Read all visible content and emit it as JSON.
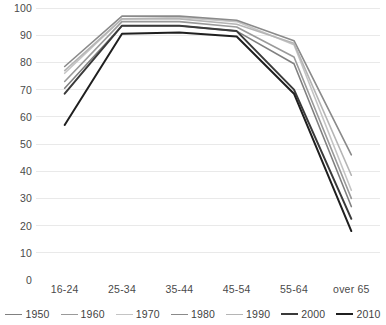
{
  "chart_data": {
    "type": "line",
    "title": "",
    "xlabel": "",
    "ylabel": "",
    "categories": [
      "16-24",
      "25-34",
      "35-44",
      "45-54",
      "55-64",
      "over 65"
    ],
    "ylim": [
      0,
      100
    ],
    "ytick_step": 10,
    "yticks": [
      100,
      90,
      80,
      70,
      60,
      50,
      40,
      30,
      20,
      10,
      0
    ],
    "grid": true,
    "legend_position": "bottom",
    "series": [
      {
        "name": "1950",
        "color": "#808080",
        "width": 1.6,
        "values": [
          70.5,
          93.5,
          93.5,
          91.5,
          79.5,
          27.0
        ]
      },
      {
        "name": "1960",
        "color": "#9a9a9a",
        "width": 1.6,
        "values": [
          73.0,
          95.0,
          95.0,
          93.0,
          82.0,
          30.0
        ]
      },
      {
        "name": "1970",
        "color": "#c4c4c4",
        "width": 1.6,
        "values": [
          76.0,
          96.0,
          96.5,
          95.0,
          86.5,
          33.0
        ]
      },
      {
        "name": "1980",
        "color": "#8a8a8a",
        "width": 1.6,
        "values": [
          78.5,
          97.0,
          97.0,
          95.5,
          88.0,
          46.0
        ]
      },
      {
        "name": "1990",
        "color": "#b5b5b5",
        "width": 1.6,
        "values": [
          77.0,
          96.0,
          96.0,
          94.0,
          87.0,
          38.5
        ]
      },
      {
        "name": "2000",
        "color": "#3a3a3a",
        "width": 2.0,
        "values": [
          68.5,
          93.5,
          93.5,
          91.5,
          70.0,
          22.5
        ]
      },
      {
        "name": "2010",
        "color": "#1f1f1f",
        "width": 2.0,
        "values": [
          57.0,
          90.5,
          91.0,
          89.5,
          68.5,
          18.0
        ]
      }
    ]
  }
}
